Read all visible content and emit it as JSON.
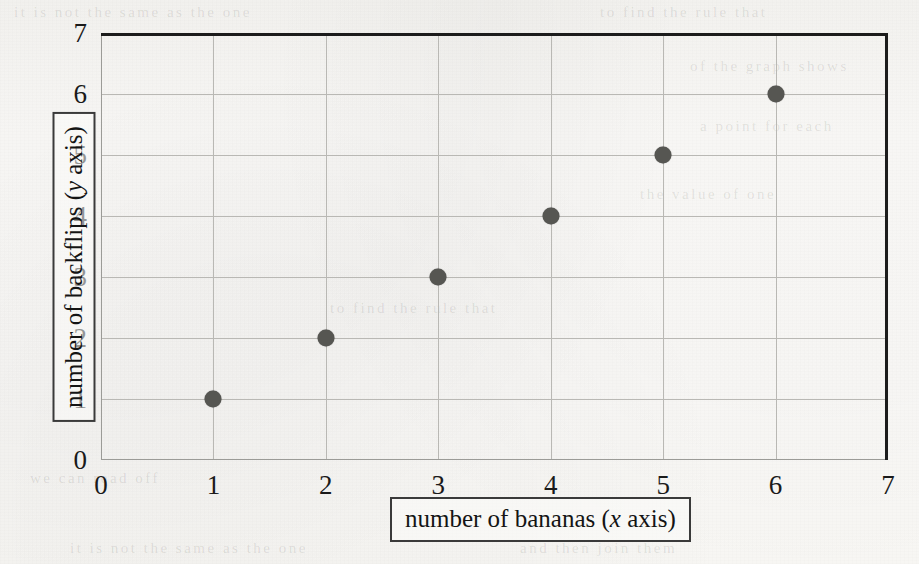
{
  "figure": {
    "background_color": "#fbfaf8",
    "frame_color": "#1c1c1c",
    "gridline_color": "#b9b8b4",
    "marker_color": "#565652"
  },
  "axis_titles": {
    "x_prefix": "number of bananas (",
    "x_var": "x",
    "x_suffix": " axis)",
    "y_prefix": "number of backflips (",
    "y_var": "y",
    "y_suffix": " axis)"
  },
  "ghost_text": {
    "lines": [
      "it is not the same as the one",
      "to find the rule that",
      "of the graph shows",
      "a point for each",
      "the value of one",
      "we can read off",
      "and then join them"
    ]
  },
  "chart_data": {
    "type": "scatter",
    "title": "",
    "xlabel": "number of bananas (x axis)",
    "ylabel": "number of backflips (y axis)",
    "x": [
      1,
      2,
      3,
      4,
      5,
      6
    ],
    "y": [
      1,
      2,
      3,
      4,
      5,
      6
    ],
    "points": [
      {
        "x": 1,
        "y": 1
      },
      {
        "x": 2,
        "y": 2
      },
      {
        "x": 3,
        "y": 3
      },
      {
        "x": 4,
        "y": 4
      },
      {
        "x": 5,
        "y": 5
      },
      {
        "x": 6,
        "y": 6
      }
    ],
    "xlim": [
      0,
      7
    ],
    "ylim": [
      0,
      7
    ],
    "xticks": [
      0,
      1,
      2,
      3,
      4,
      5,
      6,
      7
    ],
    "yticks": [
      0,
      1,
      2,
      3,
      4,
      5,
      6,
      7
    ],
    "xtick_labels": [
      "0",
      "1",
      "2",
      "3",
      "4",
      "5",
      "6",
      "7"
    ],
    "ytick_labels": [
      "0",
      "1",
      "2",
      "3",
      "4",
      "5",
      "6",
      "7"
    ],
    "grid": true,
    "legend": null,
    "marker": "filled-circle"
  }
}
